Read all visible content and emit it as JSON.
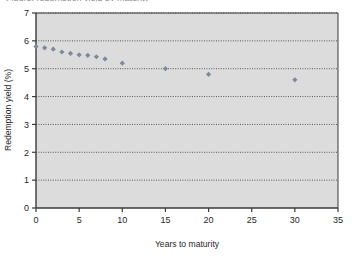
{
  "figure": {
    "cropped_caption": "Figure: redemption yield by maturity",
    "background_color": "#ffffff",
    "plot_background_color": "#dcdcdc",
    "axis_color": "#3a3a3a",
    "gridline_color": "#4a4a4a",
    "marker_color": "#7d8a9c",
    "text_color": "#1f1f1f"
  },
  "chart_data": {
    "type": "scatter",
    "title": "",
    "xlabel": "Years to maturity",
    "ylabel": "Redemption yield (%)",
    "xlim": [
      0,
      35
    ],
    "ylim": [
      0,
      7
    ],
    "xticks": [
      0,
      5,
      10,
      15,
      20,
      25,
      30,
      35
    ],
    "yticks": [
      0,
      1,
      2,
      3,
      4,
      5,
      6,
      7
    ],
    "xtick_labels": [
      "0",
      "5",
      "10",
      "15",
      "20",
      "25",
      "30",
      "35"
    ],
    "ytick_labels": [
      "0",
      "1",
      "2",
      "3",
      "4",
      "5",
      "6",
      "7"
    ],
    "grid": "horizontal-dotted",
    "legend": "none",
    "marker": "diamond",
    "series": [
      {
        "name": "Redemption yield",
        "x": [
          0,
          1,
          2,
          3,
          4,
          5,
          6,
          7,
          8,
          10,
          15,
          20,
          30
        ],
        "y": [
          5.8,
          5.75,
          5.7,
          5.6,
          5.55,
          5.5,
          5.48,
          5.43,
          5.35,
          5.2,
          5.0,
          4.8,
          4.6
        ]
      }
    ]
  }
}
